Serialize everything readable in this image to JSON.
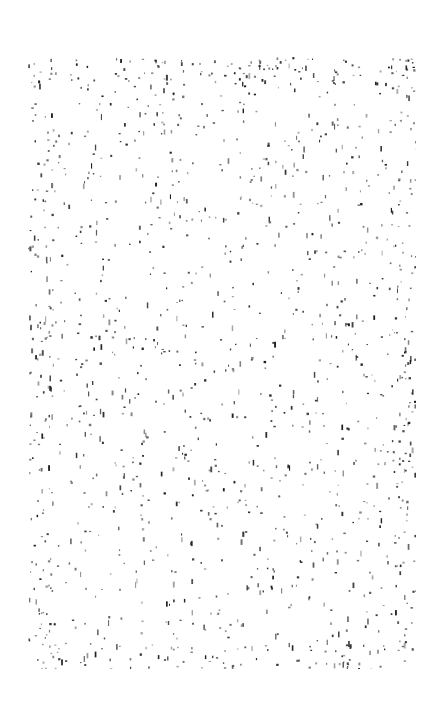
{
  "canvas": {
    "width": 445,
    "height": 727,
    "background": "#ffffff"
  },
  "texture": {
    "type": "speckle-noise",
    "region": {
      "x": 28,
      "y": 57,
      "width": 388,
      "height": 612
    },
    "speck_color": "#1a1a1a",
    "density": 1400,
    "edge_density_boost": 2.2,
    "seed": 12345
  }
}
